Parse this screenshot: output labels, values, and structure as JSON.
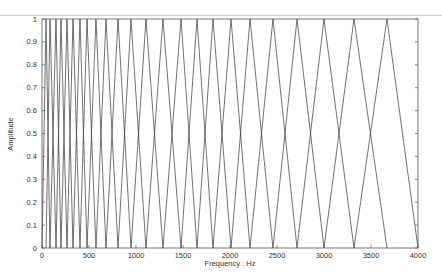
{
  "chart_data": {
    "type": "line",
    "title": "",
    "xlabel": "Frequency : Hz",
    "ylabel": "Amplitude",
    "xlim": [
      0,
      4000
    ],
    "ylim": [
      0,
      1
    ],
    "grid": false,
    "legend": null,
    "x_ticks": [
      0,
      500,
      1000,
      1500,
      2000,
      2500,
      3000,
      3500,
      4000
    ],
    "x_tick_labels": [
      "0",
      "500",
      "1000",
      "1500",
      "2000",
      "2500",
      "3000",
      "3500",
      "4000"
    ],
    "y_ticks": [
      0,
      0.1,
      0.2,
      0.3,
      0.4,
      0.5,
      0.6,
      0.7,
      0.8,
      0.9,
      1
    ],
    "y_tick_labels": [
      "0",
      "0.1",
      "0.2",
      "0.3",
      "0.4",
      "0.5",
      "0.6",
      "0.7",
      "0.8",
      "0.9",
      "1"
    ],
    "filter_edges_hz": [
      0,
      43,
      85,
      149,
      202,
      266,
      330,
      404,
      479,
      574,
      681,
      809,
      947,
      1106,
      1287,
      1479,
      1649,
      1819,
      2011,
      2213,
      2457,
      2713,
      3000,
      3319,
      3670,
      4000
    ],
    "filter_centers_hz": [
      43,
      85,
      149,
      202,
      266,
      330,
      404,
      479,
      574,
      681,
      809,
      947,
      1106,
      1287,
      1479,
      1649,
      1819,
      2011,
      2213,
      2457,
      2713,
      3000,
      3319,
      3670
    ],
    "num_filters": 24,
    "line_color": "#333333"
  }
}
